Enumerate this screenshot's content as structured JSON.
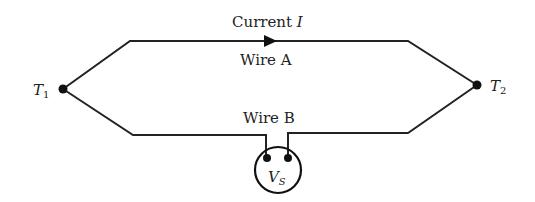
{
  "diagram": {
    "type": "thermocouple circuit",
    "labels": {
      "current": "Current ",
      "current_symbol": "I",
      "wire_a": "Wire A",
      "wire_b": "Wire B",
      "t1": "T",
      "t1_sub": "1",
      "t2": "T",
      "t2_sub": "2",
      "vs": "V",
      "vs_sub": "S"
    },
    "nodes": [
      {
        "id": "T1",
        "label": "T1"
      },
      {
        "id": "T2",
        "label": "T2"
      },
      {
        "id": "VS",
        "label": "VS",
        "kind": "voltmeter"
      }
    ],
    "edges": [
      {
        "from": "T1",
        "to": "T2",
        "label": "Wire A",
        "annotation": "Current I",
        "direction": "T1→T2"
      },
      {
        "from": "T2",
        "to": "T1",
        "label": "Wire B",
        "via": "VS"
      }
    ],
    "colors": {
      "stroke": "#222222",
      "background": "#ffffff"
    }
  }
}
